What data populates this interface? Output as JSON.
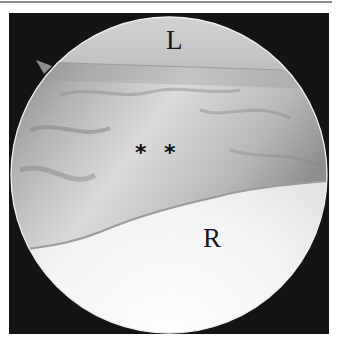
{
  "figure": {
    "type": "arthroscopic view",
    "labels": {
      "top": "L",
      "bottom": "R",
      "markers": [
        "*",
        "*"
      ]
    },
    "colors": {
      "frame": "#141414",
      "cap": "#c9c9c9",
      "tissue_mid": "#bdbdbd",
      "lower_surface": "#e6e6e6",
      "rim": "#f2f2f2"
    }
  }
}
